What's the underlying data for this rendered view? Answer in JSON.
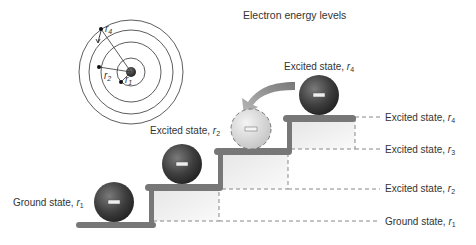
{
  "title": "Electron energy levels",
  "orbit_labels": {
    "r4": "r",
    "r4_sub": "4",
    "r2": "r",
    "r2_sub": "2",
    "r1": "r",
    "r1_sub": "1"
  },
  "ball_labels": [
    {
      "prefix": "Ground state, ",
      "var": "r",
      "sub": "1"
    },
    {
      "prefix": "Excited state, ",
      "var": "r",
      "sub": "2"
    },
    {
      "prefix": "Excited state, ",
      "var": "r",
      "sub": "4"
    }
  ],
  "level_labels": [
    {
      "prefix": "Excited state, ",
      "var": "r",
      "sub": "4"
    },
    {
      "prefix": "Excited state, ",
      "var": "r",
      "sub": "3"
    },
    {
      "prefix": "Excited state, ",
      "var": "r",
      "sub": "2"
    },
    {
      "prefix": "Ground state, ",
      "var": "r",
      "sub": "1"
    }
  ],
  "electron_symbol": "−",
  "colors": {
    "step": "#777777",
    "ball_dark": "#3a3a3a",
    "ball_light": "#d8d8d8",
    "arrow": "#8a8a8a",
    "dash": "#888888"
  }
}
